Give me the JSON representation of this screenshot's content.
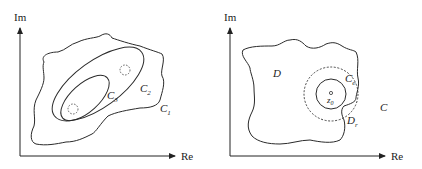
{
  "figures": [
    {
      "name": "nested-contours",
      "axes": {
        "x_label": "Re",
        "y_label": "Im"
      },
      "contours": [
        {
          "label": "C",
          "subscript": "1",
          "style": "solid"
        },
        {
          "label": "C",
          "subscript": "2",
          "style": "solid"
        },
        {
          "label": "C",
          "subscript": "3",
          "style": "solid"
        }
      ],
      "holes": [
        {
          "style": "dashed",
          "location": "upper-right"
        },
        {
          "style": "dashed",
          "location": "lower-left"
        }
      ]
    },
    {
      "name": "domain-with-disk",
      "axes": {
        "x_label": "Re",
        "y_label": "Im"
      },
      "region_label": "D",
      "boundary": {
        "label": "C",
        "style": "solid"
      },
      "inner_circle": {
        "label": "C",
        "subscript": "e",
        "style": "solid"
      },
      "disk": {
        "label": "D",
        "subscript": "r",
        "style": "dashed"
      },
      "point": {
        "label": "z",
        "subscript": "0"
      }
    }
  ],
  "colors": {
    "stroke": "#2a2a2a",
    "background": "#ffffff"
  }
}
